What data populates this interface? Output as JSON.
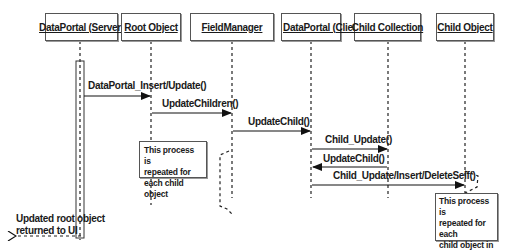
{
  "diagram": {
    "type": "sequence",
    "lifelines": [
      {
        "id": "dp_server",
        "label": "DataPortal (Server)"
      },
      {
        "id": "root",
        "label": "Root Object"
      },
      {
        "id": "fieldmgr",
        "label": "FieldManager"
      },
      {
        "id": "dp_client",
        "label": "DataPortal (Client)"
      },
      {
        "id": "child_coll",
        "label": "Child Collection"
      },
      {
        "id": "child_obj",
        "label": "Child Object"
      }
    ],
    "messages": [
      {
        "from": "dp_server",
        "to": "root",
        "label": "DataPortal_Insert/Update()"
      },
      {
        "from": "root",
        "to": "fieldmgr",
        "label": "UpdateChildren()"
      },
      {
        "from": "fieldmgr",
        "to": "dp_client",
        "label": "UpdateChild()"
      },
      {
        "from": "dp_client",
        "to": "child_coll",
        "label": "Child_Update()"
      },
      {
        "from": "child_coll",
        "to": "dp_client",
        "label": "UpdateChild()"
      },
      {
        "from": "dp_client",
        "to": "child_obj",
        "label": "Child_Update/Insert/DeleteSelf()"
      }
    ],
    "notes": [
      {
        "id": "note1",
        "lines": [
          "This process is",
          "repeated for",
          "each child object"
        ]
      },
      {
        "id": "note2",
        "lines": [
          "This process is",
          "repeated for each",
          "child object in",
          "the collection"
        ]
      }
    ],
    "return_label": {
      "lines": [
        "Updated root object",
        "returned to UI"
      ]
    }
  }
}
